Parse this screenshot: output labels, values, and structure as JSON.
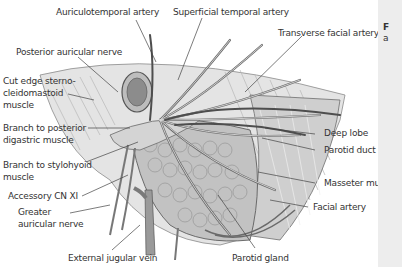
{
  "figure": {
    "labels": {
      "auriculotemporal_artery": "Auriculotemporal artery",
      "superficial_temporal_artery": "Superficial temporal artery",
      "transverse_facial_artery": "Transverse facial artery",
      "posterior_auricular_nerve": "Posterior auricular nerve",
      "cut_edge_line1": "Cut edge sterno-",
      "cut_edge_line2": "cleidomastoid",
      "cut_edge_line3": "muscle",
      "branch_post_digastric_line1": "Branch to posterior",
      "branch_post_digastric_line2": "digastric muscle",
      "branch_stylohyoid_line1": "Branch to stylohyoid",
      "branch_stylohyoid_line2": "muscle",
      "accessory_cn_xi": "Accessory CN XI",
      "greater_auricular_line1": "Greater",
      "greater_auricular_line2": "auricular nerve",
      "external_jugular_vein": "External jugular vein",
      "parotid_gland": "Parotid gland",
      "deep_lobe": "Deep lobe",
      "parotid_duct": "Parotid duct",
      "masseter_muscle": "Masseter muscle",
      "facial_artery": "Facial artery"
    },
    "colors": {
      "background": "#ffffff",
      "tissue_light": "#d9d9d9",
      "tissue_mid": "#b8b8b8",
      "tissue_dark": "#7a7a7a",
      "outline": "#555555",
      "leader_line": "#444444",
      "label_text": "#333333",
      "caption_panel": "#ededed"
    }
  },
  "caption_panel": {
    "line1": "F",
    "line2": "a"
  }
}
